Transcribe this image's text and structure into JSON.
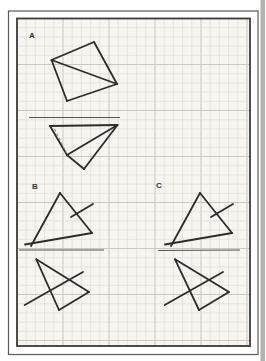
{
  "page": {
    "canvas_w": 265,
    "canvas_h": 361,
    "outside_color": "#ffffff",
    "paper_color": "#f6f5f0",
    "scan_edge_color": "#b4b2ae",
    "scan_edge_x": 260.5,
    "scan_edge_w": 4.5
  },
  "frame": {
    "outer": {
      "x": 8.5,
      "y": 11,
      "w": 249.5,
      "h": 343.5,
      "stroke": "#5a5a57",
      "width": 1.2
    },
    "inner": {
      "x": 17,
      "y": 18.5,
      "w": 233,
      "h": 327.5,
      "stroke": "#3c3a37",
      "width": 1.8
    }
  },
  "grid": {
    "spacing": 9.2,
    "major_every": 5,
    "minor_color": "#dcdad2",
    "major_color": "#c6c3ba",
    "minor_width": 0.6,
    "major_width": 0.9
  },
  "ink": {
    "shape_color": "#2e2c29",
    "shape_width": 1.8,
    "mirror_color": "#55534f",
    "mirror_width": 1.1,
    "dash_color": "#8c8a84",
    "dash_width": 1.1,
    "dash_pattern": "2.6,2.4"
  },
  "sections": [
    {
      "id": "a",
      "label": "A",
      "label_pos": [
        29,
        38
      ],
      "mirror_line": [
        [
          29,
          117.5
        ],
        [
          120,
          117.5
        ]
      ],
      "solid_segments": [
        [
          [
            94,
            42
          ],
          [
            51.5,
            60
          ]
        ],
        [
          [
            51.5,
            60
          ],
          [
            67,
            101
          ]
        ],
        [
          [
            67,
            101
          ],
          [
            117,
            84
          ]
        ],
        [
          [
            117,
            84
          ],
          [
            94,
            42
          ]
        ],
        [
          [
            51.5,
            60
          ],
          [
            117,
            84
          ]
        ],
        [
          [
            50,
            126
          ],
          [
            117.5,
            125
          ]
        ],
        [
          [
            50,
            126
          ],
          [
            67,
            155
          ]
        ],
        [
          [
            67,
            155
          ],
          [
            117.5,
            125
          ]
        ],
        [
          [
            67,
            155
          ],
          [
            84,
            169
          ]
        ],
        [
          [
            84,
            169
          ],
          [
            117.5,
            125
          ]
        ]
      ],
      "dashed_segments": [
        [
          [
            54.5,
            129
          ],
          [
            66.5,
            153
          ]
        ]
      ]
    },
    {
      "id": "b",
      "label": "B",
      "label_pos": [
        32,
        189
      ],
      "mirror_line": [
        [
          19,
          250
        ],
        [
          104,
          250
        ]
      ],
      "solid_segments": [
        [
          [
            60,
            193
          ],
          [
            31,
            246
          ]
        ],
        [
          [
            25,
            244.5
          ],
          [
            92,
            233
          ]
        ],
        [
          [
            60,
            193
          ],
          [
            92,
            233
          ]
        ],
        [
          [
            71,
            217
          ],
          [
            93,
            204
          ]
        ],
        [
          [
            36.3,
            259.3
          ],
          [
            89,
            292
          ]
        ],
        [
          [
            89,
            292
          ],
          [
            59,
            310
          ]
        ],
        [
          [
            59,
            310
          ],
          [
            36.3,
            259.3
          ]
        ],
        [
          [
            24.7,
            305
          ],
          [
            83,
            272
          ]
        ]
      ],
      "dashed_segments": []
    },
    {
      "id": "c",
      "label": "C",
      "label_pos": [
        156,
        188
      ],
      "mirror_line": [
        [
          158,
          250.5
        ],
        [
          240,
          250
        ]
      ],
      "solid_segments": [
        [
          [
            200,
            193
          ],
          [
            171,
            246
          ]
        ],
        [
          [
            165,
            244.5
          ],
          [
            232,
            233
          ]
        ],
        [
          [
            200,
            193
          ],
          [
            232,
            233
          ]
        ],
        [
          [
            211,
            217
          ],
          [
            233,
            204
          ]
        ],
        [
          [
            175,
            259.3
          ],
          [
            229,
            292
          ]
        ],
        [
          [
            229,
            292
          ],
          [
            199,
            310
          ]
        ],
        [
          [
            199,
            310
          ],
          [
            175,
            259.3
          ]
        ],
        [
          [
            164.7,
            305
          ],
          [
            223,
            272
          ]
        ]
      ],
      "dashed_segments": []
    }
  ]
}
